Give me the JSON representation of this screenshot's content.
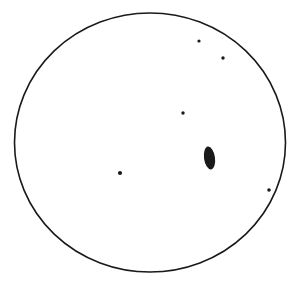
{
  "drawing": {
    "background": "#ffffff",
    "ink": "#1a1a1a",
    "field_circle": {
      "cx": 150,
      "cy": 142.5,
      "rx": 135.5,
      "ry": 129.5,
      "stroke_width": 1.6
    },
    "dots": [
      {
        "cx": 199,
        "cy": 41,
        "r": 1.6
      },
      {
        "cx": 223,
        "cy": 58,
        "r": 1.7
      },
      {
        "cx": 183,
        "cy": 113,
        "r": 1.7
      },
      {
        "cx": 120,
        "cy": 173,
        "r": 2.1
      },
      {
        "cx": 269,
        "cy": 190,
        "r": 1.8
      }
    ],
    "spot": {
      "cx": 209.5,
      "cy": 158,
      "rx": 5.5,
      "ry": 11.5
    }
  }
}
